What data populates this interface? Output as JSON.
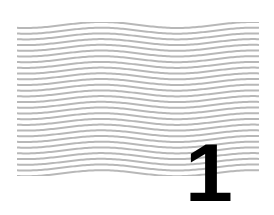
{
  "pattern": {
    "type": "wavy-lines",
    "line_color": "#b8b8b8",
    "line_count": 27
  },
  "badge": {
    "number": "1",
    "color": "#000000"
  }
}
